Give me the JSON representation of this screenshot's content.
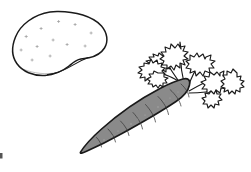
{
  "image": {
    "kind": "line-art-illustration",
    "subject": "potato-and-carrot",
    "width": 251,
    "height": 172,
    "background_color": "#ffffff",
    "style": "black outline coloring-book drawing with flat gray fill"
  },
  "palette": {
    "background": "#ffffff",
    "outline": "#1a1a1a",
    "carrot_fill": "#8a8a8a",
    "carrot_ridge": "#3a3a3a",
    "carrot_speck": "#b9b9b9",
    "potato_fill": "#ffffff",
    "potato_eye": "#9a9a9a",
    "edge_speck": "#555555"
  },
  "objects": [
    {
      "id": "potato",
      "label": "potato",
      "description": "oval tuber drawn as an unfilled outline with faint scattered eyes and a small lobe notch on the lower right",
      "bounds": {
        "x": 13,
        "y": 11,
        "width": 95,
        "height": 65
      },
      "fill": "#ffffff",
      "outline": "#1a1a1a",
      "eye_count": 12
    },
    {
      "id": "carrot",
      "label": "carrot",
      "description": "tapered root filled flat gray, tip pointing down-left, crown at upper right, crossed by curved ridge lines",
      "bounds": {
        "x": 78,
        "y": 74,
        "width": 112,
        "height": 80
      },
      "fill": "#8a8a8a",
      "outline": "#1f1f1f",
      "ridge_count": 8,
      "tip": {
        "x": 80,
        "y": 152
      },
      "crown": {
        "x": 186,
        "y": 84
      }
    },
    {
      "id": "carrot-greens",
      "label": "carrot greens",
      "description": "fern-like jagged leaf fronds, unfilled white with black outlines, fanning up and right from the carrot crown",
      "bounds": {
        "x": 140,
        "y": 35,
        "width": 106,
        "height": 66
      },
      "fill": "#ffffff",
      "outline": "#1a1a1a",
      "frond_count": 6
    },
    {
      "id": "edge-speck",
      "label": "edge speck",
      "description": "tiny stray dark mark at the far left border of the image",
      "bounds": {
        "x": 0,
        "y": 153,
        "width": 3,
        "height": 6
      },
      "fill": "#555555"
    }
  ]
}
